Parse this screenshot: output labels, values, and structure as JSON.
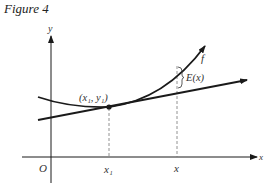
{
  "figure": {
    "title": "Figure 4",
    "axis_labels": {
      "x": "x",
      "y": "y",
      "origin": "O"
    },
    "curve_label": "f",
    "point_label": "(x₁, y₁)",
    "tick_labels": {
      "x1": "x₁",
      "x": "x"
    },
    "error_label": "E(x)",
    "colors": {
      "stroke": "#1a1a1a",
      "dashed": "#777777",
      "text": "#333333"
    }
  }
}
